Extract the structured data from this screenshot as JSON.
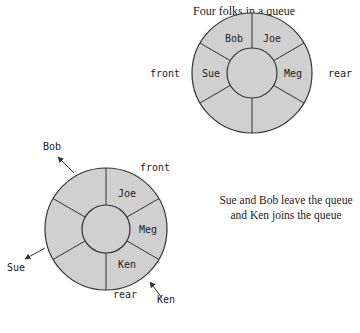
{
  "title": "Four folks in a queue",
  "caption": "Sue and Bob leave the queue and Ken joins the queue",
  "colors": {
    "ring_fill": "#d0d0d0",
    "stroke": "#333333",
    "background": "#ffffff"
  },
  "diagram1": {
    "slots": [
      "Bob",
      "Joe",
      "Meg",
      "",
      "",
      "Sue"
    ],
    "front_label": "front",
    "rear_label": "rear"
  },
  "diagram2": {
    "slots": [
      "",
      "Joe",
      "Meg",
      "Ken",
      "",
      ""
    ],
    "front_label": "front",
    "rear_label": "rear",
    "leaving": [
      "Bob",
      "Sue"
    ],
    "joining": "Ken"
  }
}
